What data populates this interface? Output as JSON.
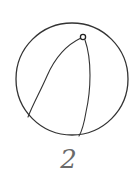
{
  "figure": {
    "label": "2",
    "colors": {
      "stroke": "#333333",
      "label": "#6a6a6a",
      "background": "#ffffff"
    },
    "circle": {
      "cx": 72,
      "cy": 79,
      "r": 56
    },
    "pole_point": {
      "x": 83,
      "y": 37,
      "r": 2.6
    },
    "curves": [
      {
        "name": "left-great-circle-arc",
        "path": "M 81 38 C 64 46, 54 60, 47 76 C 40 92, 33 104, 28 117"
      },
      {
        "name": "right-great-circle-arc",
        "path": "M 85 40 C 92 60, 91 90, 86 112 C 84 124, 82 131, 79 136"
      }
    ]
  }
}
